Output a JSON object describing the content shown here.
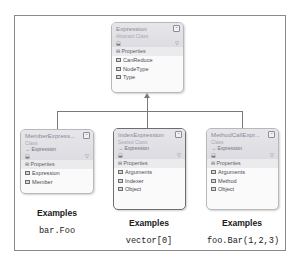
{
  "diagram": {
    "root": {
      "name": "Expression",
      "stereotype": "Abstract Class",
      "base": "",
      "section": "Properties",
      "properties": [
        "CanReduce",
        "NodeType",
        "Type"
      ]
    },
    "children": [
      {
        "name": "MemberExpress...",
        "stereotype": "Class",
        "base": "→ Expression",
        "section": "Properties",
        "properties": [
          "Expression",
          "Member"
        ],
        "examples_label": "Examples",
        "example": "bar.Foo"
      },
      {
        "name": "IndexExpression",
        "stereotype": "Sealed Class",
        "base": "→ Expression",
        "section": "Properties",
        "properties": [
          "Arguments",
          "Indexer",
          "Object"
        ],
        "examples_label": "Examples",
        "example": "vector[0]",
        "selected": true
      },
      {
        "name": "MethodCallExpr...",
        "stereotype": "Class",
        "base": "→ Expression",
        "section": "Properties",
        "properties": [
          "Arguments",
          "Method",
          "Object"
        ],
        "examples_label": "Examples",
        "example": "foo.Bar(1,2,3)"
      }
    ],
    "icons": {
      "collapse": "⌃",
      "section_toggle": "−",
      "filter": "Y",
      "shape": "⬕"
    }
  }
}
